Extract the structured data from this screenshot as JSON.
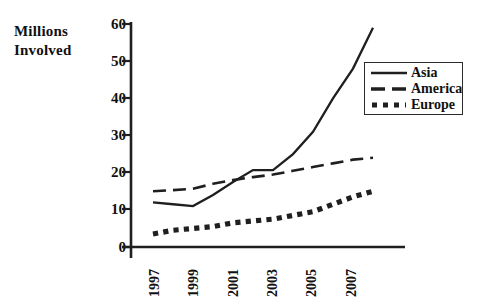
{
  "chart_data": {
    "type": "line",
    "title": "",
    "xlabel": "",
    "ylabel": "Millions Involved",
    "ylabel_lines": [
      "Millions",
      "Involved"
    ],
    "xlim": [
      1997,
      2008
    ],
    "ylim": [
      0,
      60
    ],
    "grid": false,
    "legend_position": "upper right",
    "y_ticks": [
      60,
      50,
      40,
      30,
      20,
      10,
      0
    ],
    "y_tick_labels": [
      "60",
      "50",
      "40",
      "30",
      "20",
      "10",
      "0"
    ],
    "x_ticks": [
      1997,
      1999,
      2001,
      2003,
      2005,
      2007
    ],
    "x_tick_labels": [
      "1997",
      "1999",
      "2001",
      "2003",
      "2005",
      "2007"
    ],
    "x": [
      1997,
      1998,
      1999,
      2000,
      2001,
      2002,
      2003,
      2004,
      2005,
      2006,
      2007,
      2008
    ],
    "series": [
      {
        "name": "Asia",
        "style": "solid",
        "color": "#1f1f1f",
        "values": [
          12.0,
          11.5,
          11.0,
          14.0,
          17.5,
          20.7,
          20.7,
          25.0,
          31.0,
          40.0,
          48.0,
          59.0
        ]
      },
      {
        "name": "America",
        "style": "dashed",
        "color": "#1f1f1f",
        "values": [
          15.0,
          15.3,
          15.7,
          17.0,
          18.0,
          18.8,
          19.5,
          20.5,
          21.5,
          22.5,
          23.5,
          24.0
        ]
      },
      {
        "name": "Europe",
        "style": "dotted",
        "color": "#1f1f1f",
        "values": [
          3.5,
          4.5,
          5.0,
          5.5,
          6.5,
          7.0,
          7.5,
          8.5,
          9.5,
          11.5,
          13.5,
          15.0
        ]
      }
    ]
  },
  "legend": {
    "entries": [
      {
        "label": "Asia",
        "style": "solid"
      },
      {
        "label": "America",
        "style": "dashed"
      },
      {
        "label": "Europe",
        "style": "dotted"
      }
    ]
  },
  "axes": {
    "line_color": "#1f1f1f"
  }
}
